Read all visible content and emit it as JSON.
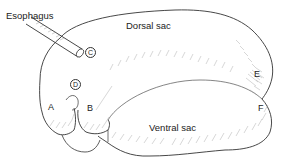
{
  "diagram": {
    "labels": {
      "esophagus": "Esophagus",
      "dorsal_sac": "Dorsal sac",
      "ventral_sac": "Ventral sac",
      "a": "A",
      "b": "B",
      "c": "C",
      "d": "D",
      "e": "E",
      "f": "F"
    },
    "colors": {
      "line": "#333333",
      "hatch": "#888888",
      "background": "#ffffff"
    }
  }
}
